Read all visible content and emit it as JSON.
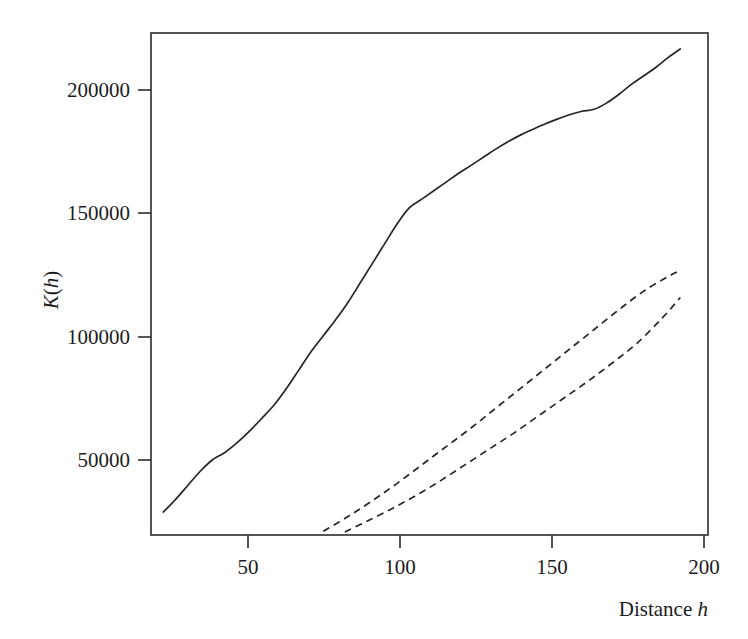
{
  "chart_data": {
    "type": "line",
    "title": "",
    "xlabel": "Distance h",
    "xlabel_plain": "Distance",
    "xlabel_italic": "h",
    "ylabel": "K(h)",
    "ylabel_italic_k": "K",
    "ylabel_paren_open": "(",
    "ylabel_italic_h": "h",
    "ylabel_paren_close": ")",
    "xlim": [
      22,
      203
    ],
    "ylim": [
      18000,
      222000
    ],
    "xticks": [
      50,
      100,
      150,
      200
    ],
    "xtick_labels": [
      "50",
      "100",
      "150",
      "200"
    ],
    "yticks": [
      50000,
      100000,
      150000,
      200000
    ],
    "ytick_labels": [
      "50000",
      "100000",
      "150000",
      "200000"
    ],
    "grid": false,
    "legend": "none",
    "frame": "box",
    "line_color": "#262626",
    "background_color": "#ffffff",
    "series": [
      {
        "name": "K(h) estimate",
        "style": "solid",
        "x": [
          26,
          30,
          34,
          38,
          42,
          46,
          50,
          54,
          58,
          62,
          66,
          70,
          74,
          78,
          82,
          86,
          90,
          94,
          98,
          102,
          106,
          110,
          114,
          118,
          122,
          126,
          130,
          134,
          138,
          142,
          146,
          150,
          154,
          158,
          162,
          166,
          170,
          174,
          178,
          182,
          186,
          190,
          194
        ],
        "y": [
          27300,
          32500,
          38200,
          43900,
          48600,
          51500,
          55500,
          60200,
          65400,
          70800,
          77500,
          85000,
          92500,
          99000,
          105500,
          112500,
          120500,
          128500,
          136500,
          144500,
          151000,
          154500,
          158000,
          161500,
          165000,
          168200,
          171500,
          174800,
          177800,
          180500,
          182800,
          185000,
          187000,
          188800,
          190200,
          191000,
          193500,
          197000,
          201000,
          204500,
          208000,
          212000,
          215500
        ]
      },
      {
        "name": "upper simulation envelope",
        "style": "dashed",
        "x": [
          78,
          86,
          94,
          102,
          110,
          118,
          126,
          134,
          142,
          150,
          158,
          166,
          174,
          182,
          190,
          194
        ],
        "y": [
          19500,
          25500,
          32000,
          39000,
          46500,
          54000,
          61500,
          69500,
          77500,
          85500,
          93500,
          101500,
          109500,
          117000,
          123000,
          125500
        ]
      },
      {
        "name": "lower simulation envelope",
        "style": "dashed",
        "x": [
          85,
          92,
          100,
          108,
          116,
          124,
          132,
          140,
          148,
          156,
          164,
          172,
          180,
          188,
          194
        ],
        "y": [
          19200,
          23500,
          28500,
          34000,
          40000,
          46500,
          53000,
          59500,
          66500,
          73500,
          80500,
          88000,
          96000,
          106000,
          114500
        ]
      }
    ]
  },
  "axes_geometry": {
    "plot_left_px": 151,
    "plot_right_px": 708,
    "plot_top_px": 33,
    "plot_bottom_px": 535
  }
}
